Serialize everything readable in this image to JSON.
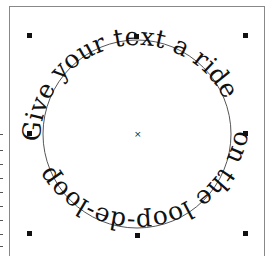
{
  "canvas": {
    "curved_text_top": "Give your text a ride",
    "curved_text_bottom": "on the loop-de-loop",
    "circle": {
      "cx": 137,
      "cy": 134,
      "r": 94
    },
    "colors": {
      "text": "#111111",
      "circle": "#555555",
      "frame": "#888888",
      "handle": "#111111"
    }
  },
  "handles": [
    {
      "name": "handle-top-left",
      "x": 27,
      "y": 33
    },
    {
      "name": "handle-top-center",
      "x": 134,
      "y": 34
    },
    {
      "name": "handle-top-right",
      "x": 243,
      "y": 33
    },
    {
      "name": "handle-middle-left",
      "x": 27,
      "y": 131
    },
    {
      "name": "handle-middle-right",
      "x": 243,
      "y": 131
    },
    {
      "name": "handle-bottom-left",
      "x": 27,
      "y": 231
    },
    {
      "name": "handle-bottom-center",
      "x": 135,
      "y": 233
    },
    {
      "name": "handle-bottom-right",
      "x": 243,
      "y": 231
    }
  ],
  "center_marker": "×"
}
